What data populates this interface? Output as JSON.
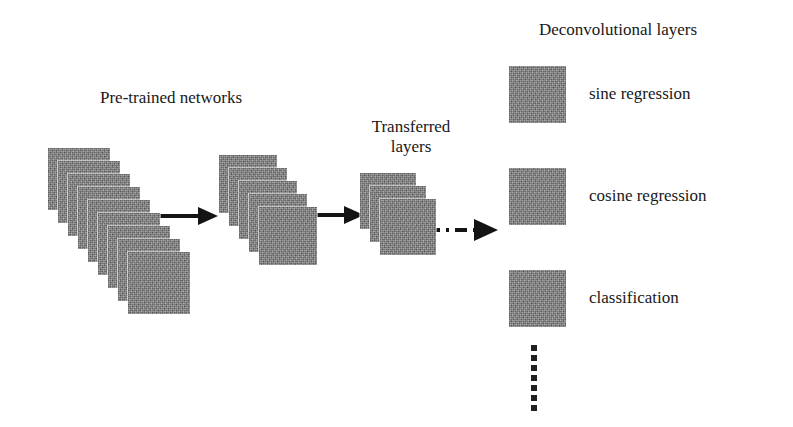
{
  "figure": {
    "type": "diagram",
    "background_color": "#ffffff",
    "layer_color": "#7d7d7d",
    "stroke_color": "#1a1a1a"
  },
  "titles": {
    "pretrained": "Pre-trained networks",
    "transferred_line1": "Transferred",
    "transferred_line2": "layers",
    "deconvolutional": "Deconvolutional layers"
  },
  "stacks": [
    {
      "name": "pretrained-network-stack",
      "label": "Pre-trained networks",
      "layer_count": 9,
      "square_size": 62,
      "origin_x": 48,
      "origin_y": 148,
      "step_x": 10,
      "step_y": 13
    },
    {
      "name": "intermediate-network-stack",
      "label": "",
      "layer_count": 5,
      "square_size": 58,
      "origin_x": 219,
      "origin_y": 155,
      "step_x": 10,
      "step_y": 13
    },
    {
      "name": "transferred-layers-stack",
      "label": "Transferred layers",
      "layer_count": 3,
      "square_size": 56,
      "origin_x": 360,
      "origin_y": 173,
      "step_x": 10,
      "step_y": 13
    }
  ],
  "arrows": [
    {
      "name": "arrow-stack1-to-stack2",
      "style": "solid",
      "x1": 166,
      "y1": 215,
      "x2": 213,
      "y2": 215
    },
    {
      "name": "arrow-stack2-to-stack3",
      "style": "solid",
      "x1": 313,
      "y1": 214,
      "x2": 358,
      "y2": 214
    },
    {
      "name": "arrow-transferred-to-deconv",
      "style": "dash-dot",
      "x1": 432,
      "y1": 229,
      "x2": 494,
      "y2": 229
    }
  ],
  "deconvolutional_layers": [
    {
      "name": "sine-regression",
      "label": "sine regression",
      "x": 509,
      "y": 66,
      "size": 57
    },
    {
      "name": "cosine-regression",
      "label": "cosine regression",
      "x": 509,
      "y": 168,
      "size": 57
    },
    {
      "name": "classification",
      "label": "classification",
      "x": 509,
      "y": 270,
      "size": 57
    }
  ],
  "ellipsis": {
    "name": "vertical-ellipsis",
    "meaning": "additional deconvolutional layers",
    "dot_count": 7
  }
}
